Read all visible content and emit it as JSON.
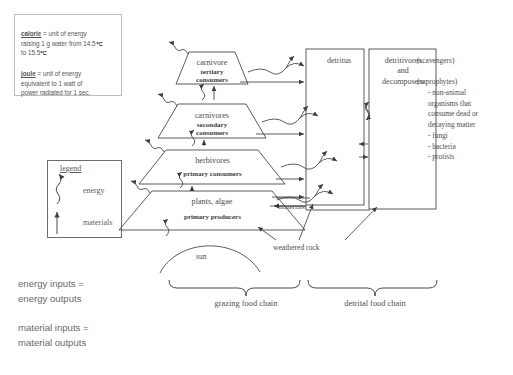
{
  "definitions": {
    "calorie": {
      "term": "calorie",
      "body": " = unit of energy\nraising 1 g water from 14.5℃\nto 15.5℃"
    },
    "joule": {
      "term": "joule",
      "body": " = unit of energy\nequivalent to 1 watt of\npower radiated for 1 sec."
    }
  },
  "legend": {
    "title": "legend",
    "items": [
      {
        "icon": "squiggly-arrow-icon",
        "label": "energy"
      },
      {
        "icon": "straight-arrow-icon",
        "label": "materials"
      }
    ]
  },
  "trophic_levels": [
    {
      "name": "carnivore",
      "sublabel": "tertiary\nconsumers"
    },
    {
      "name": "carnivores",
      "sublabel": "secondary\nconsumers"
    },
    {
      "name": "herbivores",
      "sublabel": "primary consumers"
    },
    {
      "name": "plants, algae",
      "sublabel": "primary producers"
    }
  ],
  "sun": {
    "label": "sun"
  },
  "weathered_rock": {
    "label": "weathered rock"
  },
  "materials_arrow": {
    "label": "materials"
  },
  "boxes": {
    "detritus": {
      "label": "detritus"
    },
    "detritivores": {
      "label": "detritivores\nand\ndecomposers"
    }
  },
  "annotations": {
    "scavengers": "(scavengers)",
    "saprophytes": "(saprophytes)",
    "saprophyte_detail": "- non-animal\n  organisms that\n  consume dead or\n  decaying matter\n     - fungi\n     - bacteria\n     - protists"
  },
  "food_chains": [
    {
      "label": "grazing food chain"
    },
    {
      "label": "detrital food chain"
    }
  ],
  "equations": [
    {
      "text": "energy  inputs =\nenergy outputs"
    },
    {
      "text": "material inputs =\nmaterial outputs"
    }
  ],
  "colors": {
    "stroke": "#4a4a4a",
    "text": "#555555",
    "background": "#ffffff",
    "def_border": "#bdbdbd"
  }
}
